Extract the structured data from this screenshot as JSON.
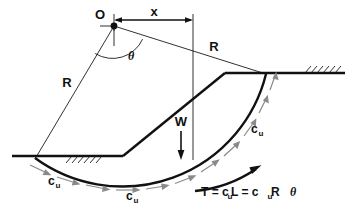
{
  "figure": {
    "background_color": "#ffffff",
    "line_color": "#111111",
    "dashed_color": "#8a8a8a"
  },
  "labels": {
    "center_point": "O",
    "horizontal_distance": "x",
    "radius_left": "R",
    "radius_right": "R",
    "angle": "θ",
    "weight": "W",
    "cohesion_1": "c",
    "cohesion_1_sub": "u",
    "cohesion_2": "c",
    "cohesion_2_sub": "u",
    "cohesion_3": "c",
    "cohesion_3_sub": "u",
    "resisting_force_eq_part1": "T = c",
    "resisting_force_eq_sub1": "u",
    "resisting_force_eq_part2": " L = c",
    "resisting_force_eq_sub2": "u",
    "resisting_force_eq_part3": " R",
    "resisting_force_eq_theta": "θ"
  },
  "geometry": {
    "center": {
      "x": 114,
      "y": 26
    },
    "radius_px": 148,
    "toe": {
      "x": 123,
      "y": 156
    },
    "crest": {
      "x": 225,
      "y": 73
    },
    "ground_left": {
      "x1": 12,
      "x2": 123,
      "y": 156
    },
    "ground_right": {
      "x1": 225,
      "x2": 345,
      "y": 73
    },
    "arc_start": {
      "x": 35,
      "y": 158
    },
    "arc_end": {
      "x": 265,
      "y": 73
    },
    "dimension_line": {
      "x1": 115,
      "x2": 193,
      "y": 20
    },
    "weight_arrow": {
      "x": 181,
      "y1": 131,
      "y2": 159
    }
  }
}
